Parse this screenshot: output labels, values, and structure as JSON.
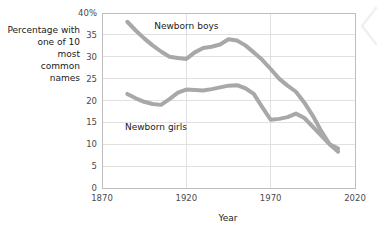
{
  "chart_data": {
    "type": "line",
    "title": "",
    "xlabel": "Year",
    "ylabel": "Percentage with one of 10 most common names",
    "ylabel_lines": [
      "Percentage with",
      "one of 10",
      "most",
      "common",
      "names"
    ],
    "xlim": [
      1870,
      2020
    ],
    "ylim": [
      0,
      40
    ],
    "xticks": [
      1870,
      1920,
      1970,
      2020
    ],
    "xtick_labels": [
      "1870",
      "1920",
      "1970",
      "2020"
    ],
    "yticks": [
      0,
      5,
      10,
      15,
      20,
      25,
      30,
      35,
      40
    ],
    "ytick_labels": [
      "0",
      "5",
      "10",
      "15",
      "20",
      "25",
      "30",
      "35",
      "40%"
    ],
    "grid": "horizontal-and-vertical",
    "legend_position": "inline-annotations",
    "series_color": "#a8a8a8",
    "line_width_px": 4,
    "series": [
      {
        "name": "Newborn boys",
        "label": "Newborn boys",
        "label_x": 1920,
        "label_y": 37,
        "x": [
          1885,
          1890,
          1895,
          1900,
          1905,
          1910,
          1915,
          1920,
          1925,
          1930,
          1935,
          1940,
          1945,
          1950,
          1955,
          1960,
          1965,
          1970,
          1975,
          1980,
          1985,
          1990,
          1995,
          2000,
          2005,
          2010
        ],
        "values": [
          38.0,
          36.0,
          34.2,
          32.6,
          31.2,
          30.0,
          29.7,
          29.5,
          31.0,
          32.0,
          32.3,
          32.8,
          34.0,
          33.7,
          32.6,
          31.0,
          29.3,
          27.2,
          25.0,
          23.4,
          22.0,
          19.5,
          16.5,
          13.0,
          10.0,
          8.3
        ]
      },
      {
        "name": "Newborn girls",
        "label": "Newborn girls",
        "label_x": 1902,
        "label_y": 14,
        "x": [
          1885,
          1890,
          1895,
          1900,
          1905,
          1910,
          1915,
          1920,
          1925,
          1930,
          1935,
          1940,
          1945,
          1950,
          1955,
          1960,
          1965,
          1970,
          1975,
          1980,
          1985,
          1990,
          1995,
          2000,
          2005,
          2010
        ],
        "values": [
          21.5,
          20.5,
          19.7,
          19.2,
          19.0,
          20.3,
          21.8,
          22.5,
          22.4,
          22.3,
          22.6,
          23.0,
          23.4,
          23.5,
          22.8,
          21.5,
          18.5,
          15.6,
          15.8,
          16.2,
          17.0,
          16.0,
          14.0,
          12.0,
          10.0,
          9.0
        ]
      }
    ]
  }
}
